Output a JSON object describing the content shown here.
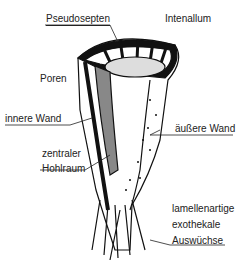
{
  "diagram": {
    "labels": {
      "pseudosepten": "Pseudosepten",
      "intervallum": "Intenallum",
      "poren": "Poren",
      "innere_wand": "innere Wand",
      "aeussere_wand": "äußere Wand",
      "zentraler_1": "zentraler",
      "zentraler_2": "Hohlraum",
      "auswuechse_1": "lamellenartige",
      "auswuechse_2": "exothekale",
      "auswuechse_3": "Auswüchse"
    }
  }
}
